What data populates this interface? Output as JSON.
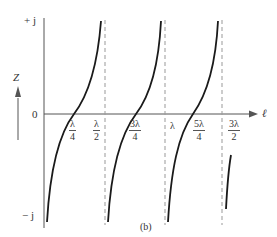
{
  "figure": {
    "caption": "(b)",
    "y_axis": {
      "label": "Z",
      "top_label": "+ j",
      "zero_label": "0",
      "bottom_label": "− j"
    },
    "x_axis": {
      "label": "ℓ"
    },
    "ticks": [
      {
        "id": "l4",
        "num": "λ",
        "den": "4"
      },
      {
        "id": "l2",
        "num": "λ",
        "den": "2"
      },
      {
        "id": "l34",
        "num": "3λ",
        "den": "4"
      },
      {
        "id": "l1",
        "text": "λ"
      },
      {
        "id": "l54",
        "num": "5λ",
        "den": "4"
      },
      {
        "id": "l32",
        "num": "3λ",
        "den": "2"
      }
    ],
    "colors": {
      "curve": "#1a1a1a",
      "axis": "#555555",
      "dashed": "#999999",
      "text": "#333333"
    }
  }
}
